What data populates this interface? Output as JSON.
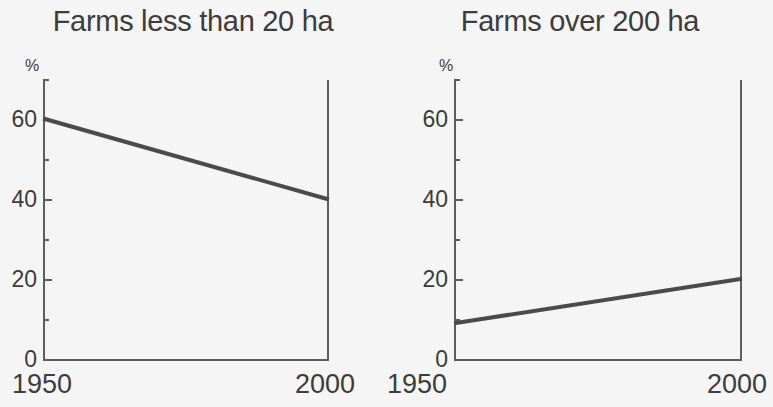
{
  "figure": {
    "background_color": "#f5f5f5",
    "ink_color": "#3c3c3c",
    "axis_color": "#5d5d5d",
    "line_color": "#4a4a4a"
  },
  "panels": [
    {
      "title": "Farms less than 20 ha",
      "y_unit": "%",
      "y_labels": [
        "60",
        "40",
        "20",
        "0"
      ],
      "x_labels": [
        "1950",
        "2000"
      ]
    },
    {
      "title": "Farms over 200 ha",
      "y_unit": "%",
      "y_labels": [
        "60",
        "40",
        "20",
        "0"
      ],
      "x_labels": [
        "1950",
        "2000"
      ]
    }
  ],
  "chart_data": [
    {
      "type": "line",
      "title": "Farms less than 20 ha",
      "xlabel": "",
      "ylabel": "%",
      "x": [
        1950,
        2000
      ],
      "values": [
        60,
        40
      ],
      "categories": [
        "1950",
        "2000"
      ],
      "xlim": [
        1950,
        2000
      ],
      "ylim": [
        0,
        72
      ],
      "ytick_labels": [
        "0",
        "20",
        "40",
        "60"
      ],
      "yticks_major": [
        0,
        20,
        40,
        60
      ],
      "yticks_minor": [
        10,
        30,
        50,
        70
      ],
      "xtick_labels": [
        "1950",
        "2000"
      ],
      "grid": false,
      "legend": false
    },
    {
      "type": "line",
      "title": "Farms over 200 ha",
      "xlabel": "",
      "ylabel": "%",
      "x": [
        1950,
        2000
      ],
      "values": [
        9,
        20
      ],
      "categories": [
        "1950",
        "2000"
      ],
      "xlim": [
        1950,
        2000
      ],
      "ylim": [
        0,
        72
      ],
      "ytick_labels": [
        "0",
        "20",
        "40",
        "60"
      ],
      "yticks_major": [
        0,
        20,
        40,
        60
      ],
      "yticks_minor": [
        10,
        30,
        50,
        70
      ],
      "xtick_labels": [
        "1950",
        "2000"
      ],
      "grid": false,
      "legend": false
    }
  ]
}
